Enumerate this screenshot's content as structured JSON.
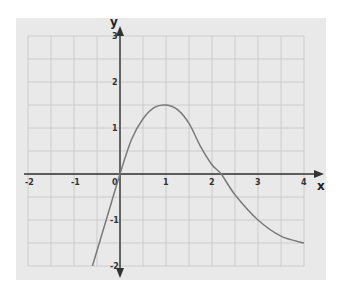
{
  "chart_data": {
    "type": "line",
    "title": "",
    "xlabel": "x",
    "ylabel": "y",
    "xlim": [
      -2.2,
      4.2
    ],
    "ylim": [
      -2.2,
      3.2
    ],
    "grid": true,
    "grid_step": 0.5,
    "x_ticks": [
      -2,
      -1,
      0,
      1,
      2,
      3,
      4
    ],
    "x_tick_labels": [
      "-2",
      "-1",
      "0",
      "1",
      "2",
      "3",
      "4"
    ],
    "y_ticks": [
      -2,
      -1,
      1,
      2,
      3
    ],
    "y_tick_labels": [
      "-2",
      "-1",
      "1",
      "2",
      "3"
    ],
    "legend": null,
    "series": [
      {
        "name": "f(x)",
        "color": "#7a7a7a",
        "x": [
          -0.6,
          -0.3,
          0,
          0.25,
          0.5,
          0.75,
          1.0,
          1.25,
          1.5,
          1.75,
          2.0,
          2.2,
          2.5,
          3.0,
          3.5,
          4.0
        ],
        "y": [
          -2.0,
          -1.0,
          0,
          0.75,
          1.2,
          1.45,
          1.5,
          1.4,
          1.1,
          0.6,
          0.2,
          0,
          -0.45,
          -1.0,
          -1.35,
          -1.5
        ]
      }
    ]
  },
  "colors": {
    "panel": "#e9e9e9",
    "grid": "#c4c4c4",
    "axis": "#333333",
    "curve": "#7a7a7a"
  },
  "labels": {
    "x_axis": "x",
    "y_axis": "y",
    "origin": "0"
  }
}
